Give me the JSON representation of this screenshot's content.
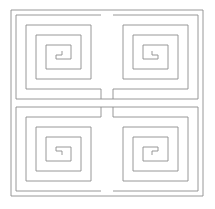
{
  "figure": {
    "title": "Square Spiral Quadrant Pattern",
    "canvas": {
      "width": 215,
      "height": 209
    },
    "background_color": "#ffffff",
    "line_color": "#8c8c8c",
    "line_width": 0.9,
    "element_count_label": "4 spirals"
  },
  "frame": {
    "name": "outer-border",
    "x": 11,
    "y": 10,
    "width": 192,
    "height": 186
  },
  "geometry": {
    "ring_spacing": 9.5,
    "turns_per_spiral": 4,
    "center_gap": 6
  },
  "chart_data": {
    "type": "line",
    "title": "Square Spiral Quadrant Pattern",
    "xlabel": "",
    "ylabel": "",
    "xlim": [
      0,
      215
    ],
    "ylim": [
      0,
      209
    ],
    "grid": false,
    "legend": "none",
    "series": [
      {
        "name": "outer-frame",
        "values": [
          [
            11,
            10
          ],
          [
            203,
            10
          ],
          [
            203,
            196
          ],
          [
            11,
            196
          ],
          [
            11,
            10
          ]
        ]
      },
      {
        "name": "spiral-top-left",
        "orientation": "opening-right",
        "bounds": [
          16,
          15,
          85,
          84
        ],
        "values": [
          [
            101,
            15
          ],
          [
            16,
            15
          ],
          [
            16,
            99
          ],
          [
            101,
            99
          ],
          [
            101,
            89
          ],
          [
            26,
            89
          ],
          [
            26,
            25
          ],
          [
            91,
            25
          ],
          [
            91,
            79
          ],
          [
            36,
            79
          ],
          [
            36,
            35
          ],
          [
            81,
            35
          ],
          [
            81,
            69
          ],
          [
            46,
            69
          ],
          [
            46,
            45
          ],
          [
            71,
            45
          ],
          [
            71,
            59
          ],
          [
            56,
            59
          ],
          [
            56,
            55
          ],
          [
            62,
            55
          ],
          [
            62,
            51
          ]
        ]
      },
      {
        "name": "spiral-top-right",
        "orientation": "opening-left",
        "bounds": [
          113,
          15,
          85,
          84
        ],
        "values": [
          [
            113,
            15
          ],
          [
            198,
            15
          ],
          [
            198,
            99
          ],
          [
            113,
            99
          ],
          [
            113,
            89
          ],
          [
            188,
            89
          ],
          [
            188,
            25
          ],
          [
            123,
            25
          ],
          [
            123,
            79
          ],
          [
            178,
            79
          ],
          [
            178,
            35
          ],
          [
            133,
            35
          ],
          [
            133,
            69
          ],
          [
            168,
            69
          ],
          [
            168,
            45
          ],
          [
            143,
            45
          ],
          [
            143,
            59
          ],
          [
            158,
            59
          ],
          [
            158,
            55
          ],
          [
            152,
            55
          ],
          [
            152,
            51
          ]
        ]
      },
      {
        "name": "spiral-bottom-left",
        "orientation": "opening-right",
        "bounds": [
          16,
          107,
          85,
          84
        ],
        "values": [
          [
            101,
            191
          ],
          [
            16,
            191
          ],
          [
            16,
            107
          ],
          [
            101,
            107
          ],
          [
            101,
            117
          ],
          [
            26,
            117
          ],
          [
            26,
            181
          ],
          [
            91,
            181
          ],
          [
            91,
            127
          ],
          [
            36,
            127
          ],
          [
            36,
            171
          ],
          [
            81,
            171
          ],
          [
            81,
            137
          ],
          [
            46,
            137
          ],
          [
            46,
            161
          ],
          [
            71,
            161
          ],
          [
            71,
            147
          ],
          [
            56,
            147
          ],
          [
            56,
            151
          ],
          [
            62,
            151
          ],
          [
            62,
            155
          ]
        ]
      },
      {
        "name": "spiral-bottom-right",
        "orientation": "opening-left",
        "bounds": [
          113,
          107,
          85,
          84
        ],
        "values": [
          [
            113,
            191
          ],
          [
            198,
            191
          ],
          [
            198,
            107
          ],
          [
            113,
            107
          ],
          [
            113,
            117
          ],
          [
            188,
            117
          ],
          [
            188,
            181
          ],
          [
            123,
            181
          ],
          [
            123,
            127
          ],
          [
            178,
            127
          ],
          [
            178,
            171
          ],
          [
            133,
            171
          ],
          [
            133,
            137
          ],
          [
            168,
            137
          ],
          [
            168,
            161
          ],
          [
            143,
            161
          ],
          [
            143,
            147
          ],
          [
            158,
            147
          ],
          [
            158,
            151
          ],
          [
            152,
            151
          ],
          [
            152,
            155
          ]
        ]
      },
      {
        "name": "connector-upper",
        "values": [
          [
            101,
            99
          ],
          [
            113,
            99
          ]
        ]
      },
      {
        "name": "connector-lower",
        "values": [
          [
            101,
            107
          ],
          [
            113,
            107
          ]
        ]
      }
    ]
  }
}
